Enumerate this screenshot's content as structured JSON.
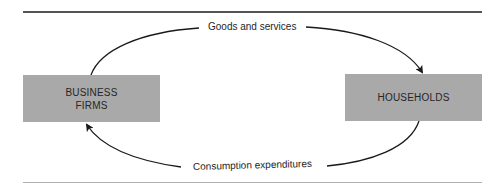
{
  "diagram": {
    "type": "circular-flow",
    "nodes": [
      {
        "id": "business",
        "label": "BUSINESS\nFIRMS"
      },
      {
        "id": "households",
        "label": "HOUSEHOLDS"
      }
    ],
    "flows": [
      {
        "from": "business",
        "to": "households",
        "label": "Goods and services"
      },
      {
        "from": "households",
        "to": "business",
        "label": "Consumption expenditures"
      }
    ],
    "colors": {
      "box_fill": "#a9a9a9",
      "text": "#262626",
      "arrow": "#1a1a1a",
      "rule_top": "#555555",
      "rule_bottom": "#b0b0b0"
    }
  }
}
